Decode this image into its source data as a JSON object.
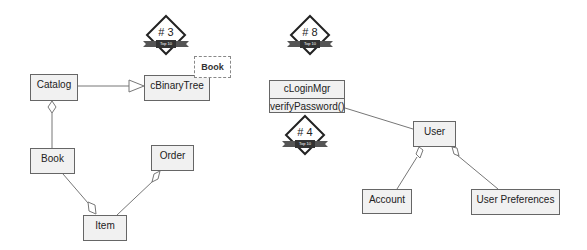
{
  "diagram": {
    "type": "UML class diagram",
    "badges": [
      {
        "id": "badge-3",
        "number": "# 3",
        "ribbon": "Top 10"
      },
      {
        "id": "badge-8",
        "number": "# 8",
        "ribbon": "Top 10"
      },
      {
        "id": "badge-4",
        "number": "# 4",
        "ribbon": "Top 10"
      }
    ],
    "classes": {
      "catalog": "Catalog",
      "cbinarytree": "cBinaryTree",
      "book": "Book",
      "order": "Order",
      "item": "Item",
      "cloginmgr": "cLoginMgr",
      "cloginmgr_op": "verifyPassword()",
      "user": "User",
      "account": "Account",
      "user_preferences": "User Preferences"
    },
    "template_param": "Book",
    "relationships": [
      {
        "from": "Catalog",
        "to": "cBinaryTree",
        "kind": "generalization"
      },
      {
        "from": "Book",
        "to": "Catalog",
        "kind": "aggregation"
      },
      {
        "from": "Book",
        "to": "Item",
        "kind": "aggregation"
      },
      {
        "from": "Item",
        "to": "Order",
        "kind": "aggregation"
      },
      {
        "from": "cLoginMgr",
        "to": "User",
        "kind": "association"
      },
      {
        "from": "Account",
        "to": "User",
        "kind": "aggregation"
      },
      {
        "from": "User Preferences",
        "to": "User",
        "kind": "aggregation"
      }
    ]
  }
}
